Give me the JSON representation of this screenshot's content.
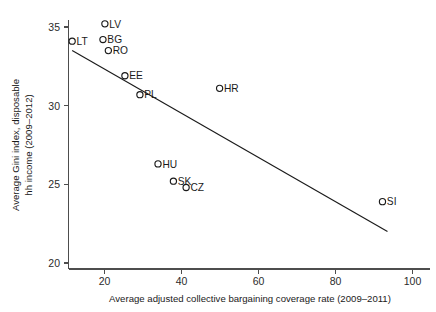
{
  "chart_data": {
    "type": "scatter",
    "title": "",
    "xlabel": "Average adjusted collective bargaining coverage rate (2009–2011)",
    "ylabel_line1": "Average Gini index, disposable",
    "ylabel_line2": "hh income (2009–2012)",
    "xlim": [
      11,
      103
    ],
    "ylim": [
      19.4,
      35.6
    ],
    "xticks": [
      20,
      40,
      60,
      80,
      100
    ],
    "xtick_labels": [
      "20",
      "40",
      "60",
      "80",
      "100"
    ],
    "yticks": [
      20,
      25,
      30,
      35
    ],
    "ytick_labels": [
      "20",
      "25",
      "30",
      "35"
    ],
    "grid": false,
    "legend": "none",
    "marker": "open-circle",
    "points": [
      {
        "label": "LV",
        "x": 20.1,
        "y": 35.2,
        "label_side": "right"
      },
      {
        "label": "LT",
        "x": 11.6,
        "y": 34.1,
        "label_side": "right"
      },
      {
        "label": "BG",
        "x": 19.6,
        "y": 34.2,
        "label_side": "right"
      },
      {
        "label": "RO",
        "x": 21.0,
        "y": 33.5,
        "label_side": "right"
      },
      {
        "label": "EE",
        "x": 25.3,
        "y": 31.9,
        "label_side": "right"
      },
      {
        "label": "PL",
        "x": 29.2,
        "y": 30.7,
        "label_side": "right"
      },
      {
        "label": "HR",
        "x": 49.9,
        "y": 31.1,
        "label_side": "right"
      },
      {
        "label": "HU",
        "x": 33.9,
        "y": 26.3,
        "label_side": "right"
      },
      {
        "label": "SK",
        "x": 37.9,
        "y": 25.2,
        "label_side": "right"
      },
      {
        "label": "CZ",
        "x": 41.2,
        "y": 24.8,
        "label_side": "right"
      },
      {
        "label": "SI",
        "x": 92.2,
        "y": 23.9,
        "label_side": "right"
      }
    ],
    "fit_line": {
      "x_start": 11.6,
      "y_start": 33.5,
      "x_end": 93.5,
      "y_end": 22.0,
      "description": "linear regression fit, negative slope"
    },
    "colors": {
      "marker_stroke": "#1a1a1a",
      "fit_line": "#1a1a1a",
      "axis": "#4d4d4d",
      "text": "#1a1a1a",
      "background": "#ffffff"
    }
  }
}
